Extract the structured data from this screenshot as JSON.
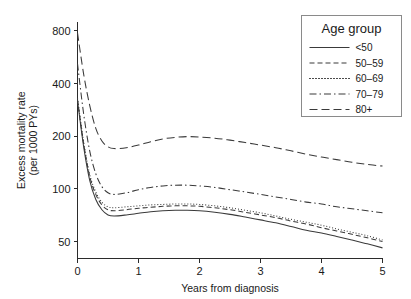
{
  "chart_data": {
    "type": "line",
    "title": "",
    "xlabel": "Years from diagnosis",
    "ylabel": "Excess mortality rate (per 1000 PYs)",
    "ylabel_line1": "Excess mortality rate",
    "ylabel_line2": "(per 1000 PYs)",
    "yscale": "log",
    "xlim": [
      0,
      5
    ],
    "ylim": [
      40,
      900
    ],
    "grid": false,
    "legend_position": "top-right",
    "legend_title": "Age group",
    "xticks": [
      0,
      1,
      2,
      3,
      4,
      5
    ],
    "xtick_labels": [
      "0",
      "1",
      "2",
      "3",
      "4",
      "5"
    ],
    "yticks": [
      50,
      100,
      200,
      400,
      800
    ],
    "ytick_labels": [
      "50",
      "100",
      "200",
      "400",
      "800"
    ],
    "x": [
      0,
      0.1,
      0.2,
      0.3,
      0.4,
      0.5,
      0.6,
      0.8,
      1.0,
      1.2,
      1.4,
      1.6,
      1.8,
      2.0,
      2.25,
      2.5,
      2.75,
      3.0,
      3.25,
      3.5,
      3.75,
      4.0,
      4.25,
      4.5,
      4.75,
      5.0
    ],
    "series": [
      {
        "name": "<50",
        "dash": "solid",
        "values": [
          320,
          175,
          112,
          87,
          76,
          71,
          70,
          71,
          72.5,
          74,
          75,
          75.5,
          75.5,
          75,
          73.5,
          71.5,
          69,
          66.5,
          64,
          61,
          58,
          56,
          53.5,
          51,
          48.5,
          46
        ]
      },
      {
        "name": "50-59",
        "dash": "dashed",
        "values": [
          325,
          182,
          118,
          93,
          81,
          76,
          75,
          76,
          77.5,
          78.5,
          79.5,
          80,
          80,
          79.5,
          78,
          76,
          73.5,
          71,
          68.5,
          65.5,
          63,
          60,
          57.5,
          55,
          52.5,
          50
        ]
      },
      {
        "name": "60-69",
        "dash": "dotted",
        "values": [
          330,
          186,
          121,
          96,
          84,
          79,
          78,
          79,
          80,
          81,
          81.5,
          82,
          82,
          81.5,
          80,
          78,
          75.5,
          73,
          70,
          67,
          64.5,
          62,
          59,
          56.5,
          54,
          51
        ]
      },
      {
        "name": "70-79",
        "dash": "dashdot",
        "values": [
          520,
          270,
          165,
          122,
          103,
          95,
          93,
          95,
          99,
          102,
          104,
          105,
          105,
          104,
          102,
          99,
          96,
          93,
          90,
          87,
          84,
          82,
          79,
          77,
          75,
          73
        ]
      },
      {
        "name": "80+",
        "dash": "longdash",
        "values": [
          780,
          455,
          300,
          222,
          188,
          174,
          170,
          172,
          178,
          186,
          193,
          197,
          199,
          198,
          195,
          190,
          184,
          178,
          172,
          165,
          158,
          152,
          147,
          142,
          138,
          135
        ]
      }
    ]
  },
  "legend": {
    "title": "Age group",
    "entries": [
      {
        "label": "<50",
        "dash": "solid"
      },
      {
        "label": "50–59",
        "dash": "dashed"
      },
      {
        "label": "60–69",
        "dash": "dotted"
      },
      {
        "label": "70–79",
        "dash": "dashdot"
      },
      {
        "label": "80+",
        "dash": "longdash"
      }
    ]
  },
  "colors": {
    "line": "#3a3a3a",
    "axis": "#2b2b2b",
    "text": "#1a1a1a",
    "background": "#ffffff",
    "legend_border": "#8a8a8a"
  }
}
